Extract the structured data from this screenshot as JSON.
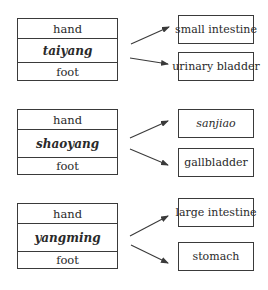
{
  "diagram": {
    "groups": [
      {
        "channel": {
          "top": "hand",
          "name": "taiyang",
          "bottom": "foot"
        },
        "organs": [
          {
            "label": "small intestine",
            "italic": false
          },
          {
            "label": "urinary bladder",
            "italic": false
          }
        ]
      },
      {
        "channel": {
          "top": "hand",
          "name": "shaoyang",
          "bottom": "foot"
        },
        "organs": [
          {
            "label": "sanjiao",
            "italic": true
          },
          {
            "label": "gallbladder",
            "italic": false
          }
        ]
      },
      {
        "channel": {
          "top": "hand",
          "name": "yangming",
          "bottom": "foot"
        },
        "organs": [
          {
            "label": "large intestine",
            "italic": false
          },
          {
            "label": "stomach",
            "italic": false
          }
        ]
      }
    ],
    "colors": {
      "line": "#3a3a3a",
      "text": "#2a2a2a",
      "background": "#ffffff"
    }
  }
}
